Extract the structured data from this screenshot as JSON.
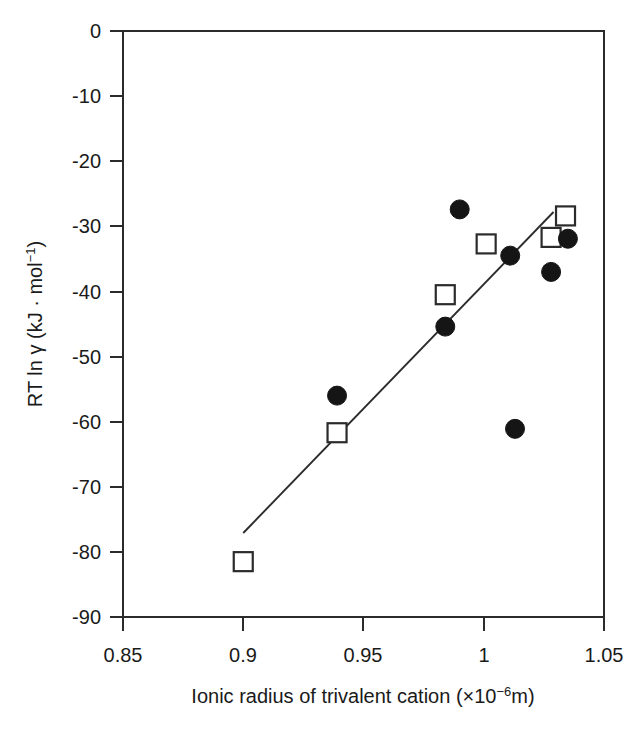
{
  "chart_data": {
    "type": "scatter",
    "title": "",
    "xlabel": "Ionic radius of trivalent cation (×10−6m)",
    "xlabel_parts": {
      "main": "Ionic radius of trivalent cation (×10",
      "sup": "−6",
      "tail": "m)"
    },
    "ylabel": "RT ln γ (kJ · mol−1)",
    "ylabel_parts": {
      "main": "RT ln γ (kJ · mol",
      "sup": "−1",
      "tail": ")"
    },
    "xlim": [
      0.85,
      1.05
    ],
    "ylim": [
      -90,
      0
    ],
    "xticks": [
      0.85,
      0.9,
      0.95,
      1,
      1.05
    ],
    "xtick_labels": [
      "0.85",
      "0.9",
      "0.95",
      "1",
      "1.05"
    ],
    "yticks": [
      0,
      -10,
      -20,
      -30,
      -40,
      -50,
      -60,
      -70,
      -80,
      -90
    ],
    "ytick_labels": [
      "0",
      "-10",
      "-20",
      "-30",
      "-40",
      "-50",
      "-60",
      "-70",
      "-80",
      "-90"
    ],
    "grid": false,
    "legend": "none",
    "frame": "box",
    "colors": {
      "axis": "#2b2b2b",
      "filled_marker": "#151515",
      "open_marker_stroke": "#2b2b2b",
      "open_marker_fill": "#ffffff",
      "trend_line": "#2b2b2b",
      "background": "#ffffff"
    },
    "series": [
      {
        "name": "open-squares",
        "marker": "open-square",
        "points": [
          {
            "x": 0.9,
            "y": -81.5
          },
          {
            "x": 0.939,
            "y": -61.7
          },
          {
            "x": 0.984,
            "y": -40.5
          },
          {
            "x": 1.001,
            "y": -32.7
          },
          {
            "x": 1.028,
            "y": -31.7
          },
          {
            "x": 1.034,
            "y": -28.4
          }
        ]
      },
      {
        "name": "filled-circles",
        "marker": "filled-circle",
        "points": [
          {
            "x": 0.939,
            "y": -56.0
          },
          {
            "x": 0.984,
            "y": -45.4
          },
          {
            "x": 0.99,
            "y": -27.4
          },
          {
            "x": 1.011,
            "y": -34.5
          },
          {
            "x": 1.013,
            "y": -61.1
          },
          {
            "x": 1.028,
            "y": -37.0
          },
          {
            "x": 1.035,
            "y": -31.9
          }
        ]
      }
    ],
    "trend_line": {
      "name": "linear-fit",
      "x0": 0.9,
      "y0": -77.1,
      "x1": 1.029,
      "y1": -27.8
    }
  }
}
